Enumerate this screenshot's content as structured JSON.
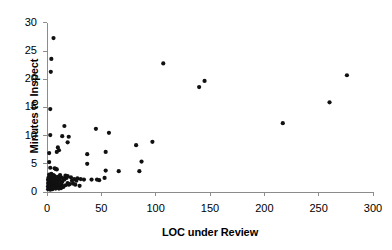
{
  "chart_data": {
    "type": "scatter",
    "title": "",
    "xlabel": "LOC under Review",
    "ylabel": "Minutes to Inspect",
    "xlim": [
      0,
      300
    ],
    "ylim": [
      0,
      30
    ],
    "xticks": [
      0,
      50,
      100,
      150,
      200,
      250,
      300
    ],
    "yticks": [
      0,
      5,
      10,
      15,
      20,
      25,
      30
    ],
    "xtick_labels": [
      "0",
      "50",
      "100",
      "150",
      "200",
      "250",
      "300"
    ],
    "ytick_labels": [
      "0",
      "5",
      "10",
      "15",
      "20",
      "25",
      "30"
    ],
    "grid": false,
    "legend": false,
    "marker": "filled-circle",
    "marker_color": "#111111",
    "axis_color": "#8c8c8c",
    "points": [
      [
        6,
        27.3
      ],
      [
        4,
        23.6
      ],
      [
        3.5,
        21.3
      ],
      [
        3,
        14.7
      ],
      [
        16,
        11.7
      ],
      [
        3,
        10.1
      ],
      [
        14,
        9.9
      ],
      [
        20,
        9.8
      ],
      [
        19,
        8.8
      ],
      [
        10,
        7.9
      ],
      [
        11,
        7.4
      ],
      [
        9,
        7.1
      ],
      [
        2,
        6.9
      ],
      [
        2,
        5.3
      ],
      [
        3,
        4.3
      ],
      [
        7,
        4.2
      ],
      [
        8,
        4.1
      ],
      [
        9,
        4.0
      ],
      [
        4,
        3.2
      ],
      [
        45,
        11.2
      ],
      [
        57,
        10.5
      ],
      [
        54,
        7.1
      ],
      [
        37,
        6.7
      ],
      [
        37,
        5.0
      ],
      [
        87,
        5.4
      ],
      [
        82,
        8.3
      ],
      [
        97,
        8.9
      ],
      [
        107,
        22.8
      ],
      [
        140,
        18.6
      ],
      [
        145,
        19.7
      ],
      [
        217,
        12.2
      ],
      [
        260,
        15.9
      ],
      [
        276,
        20.7
      ],
      [
        54,
        3.8
      ],
      [
        66,
        3.7
      ],
      [
        85,
        3.7
      ],
      [
        53,
        2.5
      ],
      [
        28,
        2.4
      ],
      [
        31,
        2.3
      ],
      [
        34,
        2.2
      ],
      [
        41,
        2.2
      ],
      [
        46,
        2.2
      ],
      [
        48,
        2.1
      ],
      [
        25,
        2.3
      ],
      [
        23,
        2.0
      ],
      [
        21,
        1.4
      ],
      [
        20,
        1.3
      ],
      [
        19,
        1.6
      ],
      [
        18,
        2.5
      ],
      [
        17,
        1.2
      ],
      [
        16,
        2.2
      ],
      [
        15,
        2.4
      ],
      [
        14,
        1.8
      ],
      [
        14,
        1.1
      ],
      [
        13,
        2.6
      ],
      [
        13,
        1.5
      ],
      [
        12,
        2.0
      ],
      [
        12,
        1.0
      ],
      [
        11,
        2.4
      ],
      [
        11,
        1.3
      ],
      [
        10,
        2.7
      ],
      [
        10,
        1.8
      ],
      [
        10,
        0.9
      ],
      [
        9,
        2.3
      ],
      [
        9,
        1.5
      ],
      [
        9,
        0.8
      ],
      [
        8,
        2.6
      ],
      [
        8,
        1.9
      ],
      [
        8,
        1.2
      ],
      [
        8,
        0.6
      ],
      [
        7,
        2.8
      ],
      [
        7,
        2.1
      ],
      [
        7,
        1.4
      ],
      [
        7,
        0.9
      ],
      [
        6,
        2.5
      ],
      [
        6,
        1.8
      ],
      [
        6,
        1.1
      ],
      [
        6,
        0.7
      ],
      [
        5,
        2.9
      ],
      [
        5,
        2.2
      ],
      [
        5,
        1.6
      ],
      [
        5,
        1.0
      ],
      [
        5,
        0.5
      ],
      [
        4,
        2.6
      ],
      [
        4,
        2.0
      ],
      [
        4,
        1.4
      ],
      [
        4,
        0.8
      ],
      [
        3,
        2.8
      ],
      [
        3,
        2.1
      ],
      [
        3,
        1.5
      ],
      [
        3,
        0.9
      ],
      [
        3,
        0.4
      ],
      [
        2,
        2.4
      ],
      [
        2,
        1.8
      ],
      [
        2,
        1.2
      ],
      [
        2,
        0.7
      ],
      [
        1.5,
        2.6
      ],
      [
        1.5,
        2.0
      ],
      [
        1.5,
        1.3
      ],
      [
        1.5,
        0.8
      ],
      [
        1,
        2.2
      ],
      [
        1,
        1.6
      ],
      [
        1,
        1.0
      ],
      [
        1,
        0.5
      ],
      [
        22,
        2.6
      ],
      [
        24,
        1.5
      ],
      [
        26,
        1.3
      ],
      [
        27,
        2.0
      ],
      [
        30,
        1.1
      ],
      [
        17,
        2.9
      ],
      [
        19,
        2.8
      ],
      [
        15,
        0.9
      ],
      [
        13,
        0.7
      ],
      [
        11,
        0.6
      ],
      [
        12,
        3.0
      ],
      [
        6,
        3.0
      ],
      [
        2,
        3.1
      ]
    ]
  }
}
